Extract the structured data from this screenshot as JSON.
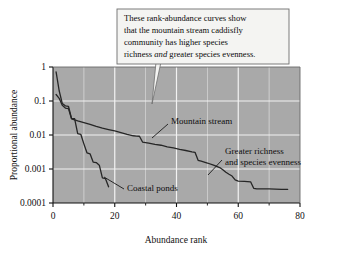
{
  "figure": {
    "background_color": "#ffffff",
    "plot_background_color": "#a9a9a9",
    "gridline_color": "#f2f2f2",
    "curve_color": "#262626",
    "axis_color": "#111111"
  },
  "callout": {
    "line1": "These rank-abundance curves show",
    "line2": "that the mountain stream caddisfly",
    "line3": "community has higher species",
    "line4_a": "richness ",
    "line4_em": "and",
    "line4_b": " greater species evenness.",
    "background_color": "#f4f4f2",
    "border_color": "#6e6e6e"
  },
  "annotations": {
    "mountain_stream": "Mountain stream",
    "coastal_ponds": "Coastal ponds",
    "greater_richness_line1": "Greater richness",
    "greater_richness_line2": "and species evenness"
  },
  "chart_data": {
    "type": "line",
    "title": "",
    "xlabel": "Abundance rank",
    "ylabel": "Proportional abundance",
    "xlim": [
      0,
      80
    ],
    "ylim": [
      0.0001,
      1
    ],
    "yscale": "log",
    "grid": true,
    "legend": "none",
    "xticks": [
      0,
      20,
      40,
      60,
      80
    ],
    "xtick_labels": [
      "0",
      "20",
      "40",
      "60",
      "80"
    ],
    "xminor_ticks": [
      10,
      30,
      50,
      70
    ],
    "yticks": [
      1,
      0.1,
      0.01,
      0.001,
      0.0001
    ],
    "ytick_labels": [
      "1",
      "0.1",
      "0.01",
      "0.001",
      "0.0001"
    ],
    "series": [
      {
        "name": "Mountain stream",
        "x": [
          1,
          2,
          3,
          4,
          5,
          6,
          7,
          8,
          10,
          12,
          14,
          16,
          18,
          20,
          22,
          24,
          26,
          27,
          28,
          29,
          31,
          33,
          35,
          37,
          39,
          41,
          43,
          45,
          46,
          47,
          48,
          50,
          52,
          54,
          55,
          56,
          57,
          58,
          59,
          60,
          62,
          64,
          65,
          66,
          70,
          74,
          76
        ],
        "y": [
          0.155,
          0.12,
          0.075,
          0.062,
          0.06,
          0.03,
          0.028,
          0.026,
          0.023,
          0.0205,
          0.018,
          0.016,
          0.0145,
          0.0132,
          0.0118,
          0.0105,
          0.0095,
          0.0093,
          0.0092,
          0.0062,
          0.0058,
          0.0053,
          0.005,
          0.0045,
          0.0042,
          0.0038,
          0.0035,
          0.0032,
          0.0031,
          0.0018,
          0.0017,
          0.0015,
          0.0013,
          0.0011,
          0.00095,
          0.0008,
          0.0007,
          0.00062,
          0.00048,
          0.00044,
          0.00043,
          0.00042,
          0.00027,
          0.00026,
          0.00026,
          0.00025,
          0.00025
        ]
      },
      {
        "name": "Coastal ponds",
        "x": [
          1,
          2,
          3,
          4,
          5,
          6,
          7,
          8,
          9,
          10,
          11,
          12,
          13,
          14,
          15,
          16,
          17,
          18
        ],
        "y": [
          0.72,
          0.2,
          0.085,
          0.072,
          0.07,
          0.031,
          0.0305,
          0.011,
          0.0105,
          0.0055,
          0.003,
          0.0028,
          0.0016,
          0.00155,
          0.0013,
          0.00055,
          0.00052,
          0.0003
        ]
      }
    ]
  }
}
